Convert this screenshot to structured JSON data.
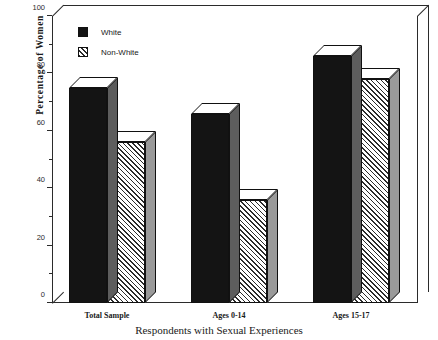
{
  "chart_data": {
    "type": "bar",
    "title": "",
    "xlabel": "Respondents with Sexual Experiences",
    "ylabel": "Percentage of Women",
    "categories": [
      "Total Sample",
      "Ages 0-14",
      "Ages 15-17"
    ],
    "series": [
      {
        "name": "White",
        "values": [
          75,
          66,
          86
        ],
        "color": "#141414",
        "pattern": "solid"
      },
      {
        "name": "Non-White",
        "values": [
          56,
          36,
          78
        ],
        "color": "#2b2b2b",
        "pattern": "diagonal-hatch"
      }
    ],
    "ylim": [
      0,
      100
    ],
    "yticks_major": [
      0,
      20,
      40,
      60,
      80,
      100
    ],
    "yticks_minor": [
      10,
      30,
      50,
      70,
      90
    ],
    "ytick_labels": [
      "0",
      "20",
      "40",
      "60",
      "80",
      "100"
    ],
    "grid": false,
    "legend_position": "top-left",
    "style": "3d-block-bars"
  },
  "axis": {
    "y_title": "Percentage of Women",
    "x_title": "Respondents with Sexual Experiences",
    "tick_labels": [
      "100",
      "80",
      "60",
      "40",
      "20",
      "0"
    ]
  },
  "legend": {
    "entries": [
      {
        "label": "White",
        "swatch": "solid-black-swatch"
      },
      {
        "label": "Non-White",
        "swatch": "hatched-swatch"
      }
    ]
  }
}
